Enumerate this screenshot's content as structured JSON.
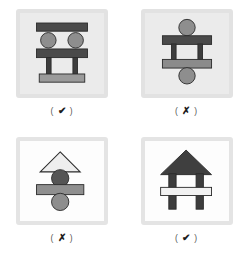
{
  "figure": {
    "type": "illustration-grid",
    "background_color": "#ffffff",
    "columns": 2,
    "rows": 2,
    "panels": [
      {
        "id": "panel-1",
        "position": "top-left",
        "panel_fill": "#ebebeb",
        "panel_border": "#e2e2e2",
        "caption": {
          "open": "(",
          "mark": "✔",
          "close": ")",
          "meaning": "correct"
        },
        "shapes": [
          {
            "name": "top-beam",
            "kind": "rect",
            "x": 18,
            "y": 11,
            "w": 56,
            "h": 9,
            "fill": "#4a4a4a",
            "stroke": "#2b2b2b"
          },
          {
            "name": "left-circle",
            "kind": "circle",
            "cx": 31,
            "cy": 30,
            "r": 8.5,
            "fill": "#8e8e8e",
            "stroke": "#2b2b2b"
          },
          {
            "name": "right-circle",
            "kind": "circle",
            "cx": 61,
            "cy": 30,
            "r": 8.5,
            "fill": "#8e8e8e",
            "stroke": "#2b2b2b"
          },
          {
            "name": "middle-beam",
            "kind": "rect",
            "x": 18,
            "y": 40,
            "w": 56,
            "h": 9,
            "fill": "#4a4a4a",
            "stroke": "#2b2b2b"
          },
          {
            "name": "left-pillar",
            "kind": "rect",
            "x": 29,
            "y": 49,
            "w": 5,
            "h": 18,
            "fill": "#3d3d3d",
            "stroke": "#2b2b2b"
          },
          {
            "name": "right-pillar",
            "kind": "rect",
            "x": 58,
            "y": 49,
            "w": 5,
            "h": 18,
            "fill": "#3d3d3d",
            "stroke": "#2b2b2b"
          },
          {
            "name": "base-beam",
            "kind": "rect",
            "x": 21,
            "y": 67,
            "w": 50,
            "h": 9,
            "fill": "#9a9a9a",
            "stroke": "#2b2b2b"
          }
        ]
      },
      {
        "id": "panel-2",
        "position": "top-right",
        "panel_fill": "#ebebeb",
        "panel_border": "#e2e2e2",
        "caption": {
          "open": "(",
          "mark": "✗",
          "close": ")",
          "meaning": "incorrect"
        },
        "shapes": [
          {
            "name": "top-circle",
            "kind": "circle",
            "cx": 46,
            "cy": 16,
            "r": 9,
            "fill": "#8e8e8e",
            "stroke": "#2b2b2b"
          },
          {
            "name": "top-beam",
            "kind": "rect",
            "x": 19,
            "y": 25,
            "w": 54,
            "h": 9,
            "fill": "#4a4a4a",
            "stroke": "#2b2b2b"
          },
          {
            "name": "left-pillar",
            "kind": "rect",
            "x": 29,
            "y": 34,
            "w": 5,
            "h": 17,
            "fill": "#3d3d3d",
            "stroke": "#2b2b2b"
          },
          {
            "name": "right-pillar",
            "kind": "rect",
            "x": 58,
            "y": 34,
            "w": 5,
            "h": 17,
            "fill": "#3d3d3d",
            "stroke": "#2b2b2b"
          },
          {
            "name": "base-beam",
            "kind": "rect",
            "x": 19,
            "y": 51,
            "w": 54,
            "h": 9,
            "fill": "#8b8b8b",
            "stroke": "#2b2b2b"
          },
          {
            "name": "bottom-circle",
            "kind": "circle",
            "cx": 46,
            "cy": 69,
            "r": 9,
            "fill": "#8e8e8e",
            "stroke": "#2b2b2b"
          }
        ]
      },
      {
        "id": "panel-3",
        "position": "bottom-left",
        "panel_fill": "#fdfdfd",
        "panel_border": "#e4e4e4",
        "caption": {
          "open": "(",
          "mark": "✗",
          "close": ")",
          "meaning": "incorrect"
        },
        "shapes": [
          {
            "name": "triangle-roof",
            "kind": "triangle",
            "cx": 44,
            "apex_y": 12,
            "base_y": 34,
            "half_w": 22,
            "fill": "#eeeeee",
            "stroke": "#2b2b2b"
          },
          {
            "name": "dark-circle",
            "kind": "circle",
            "cx": 44,
            "cy": 41,
            "r": 9.5,
            "fill": "#555555",
            "stroke": "#2b2b2b"
          },
          {
            "name": "middle-beam",
            "kind": "rect",
            "x": 18,
            "y": 48,
            "w": 52,
            "h": 11,
            "fill": "#8f8f8f",
            "stroke": "#2b2b2b"
          },
          {
            "name": "light-circle",
            "kind": "circle",
            "cx": 44,
            "cy": 67,
            "r": 9.5,
            "fill": "#8e8e8e",
            "stroke": "#2b2b2b"
          }
        ]
      },
      {
        "id": "panel-4",
        "position": "bottom-right",
        "panel_fill": "#fdfdfd",
        "panel_border": "#e4e4e4",
        "caption": {
          "open": "(",
          "mark": "✔",
          "close": ")",
          "meaning": "correct"
        },
        "shapes": [
          {
            "name": "triangle-roof",
            "kind": "triangle",
            "cx": 45,
            "apex_y": 10,
            "base_y": 37,
            "half_w": 28,
            "fill": "#3f3f3f",
            "stroke": "#2b2b2b"
          },
          {
            "name": "left-pillar",
            "kind": "rect",
            "x": 26,
            "y": 37,
            "w": 8,
            "h": 38,
            "fill": "#3d3d3d",
            "stroke": "#2b2b2b"
          },
          {
            "name": "right-pillar",
            "kind": "rect",
            "x": 56,
            "y": 37,
            "w": 8,
            "h": 38,
            "fill": "#3d3d3d",
            "stroke": "#2b2b2b"
          },
          {
            "name": "cross-beam",
            "kind": "rect",
            "x": 17,
            "y": 51,
            "w": 56,
            "h": 9,
            "fill": "#f2f2f2",
            "stroke": "#2b2b2b"
          }
        ]
      }
    ]
  }
}
